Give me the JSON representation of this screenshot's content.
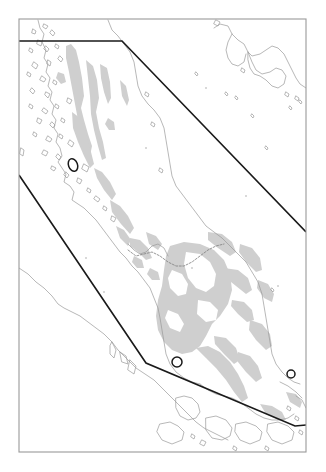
{
  "figure": {
    "kind": "reference-map",
    "region_name": "Malay Peninsula",
    "background_color": "#ffffff",
    "land_fill_color": "#ffffff",
    "highland_fill_color": "#cfcfcf",
    "coastline_color": "#9a9a9a",
    "border_color": "#8a8a8a",
    "frame_color": "#9a9a9a",
    "study_area_color": "#1a1a1a",
    "marker_color": "#1a1a1a",
    "title": "",
    "subtitle": "",
    "legend": "",
    "scale_bar": "",
    "north_arrow": "",
    "axis_labels": []
  },
  "frame": {
    "x": 19,
    "y": 19,
    "width": 287,
    "height": 433,
    "stroke_width": 1.1
  },
  "study_area": {
    "label": "",
    "stroke_width": 1.6,
    "vertices": [
      [
        19,
        41
      ],
      [
        122,
        41
      ],
      [
        306,
        232
      ],
      [
        306,
        425
      ],
      [
        295,
        426
      ],
      [
        146,
        363
      ],
      [
        19,
        175
      ]
    ],
    "segments_visible": [
      "top-horizontal",
      "upper-diagonal-to-right-frame",
      "right-frame-overlap",
      "lower-bend",
      "lower-diagonal-to-left-frame"
    ]
  },
  "markers": [
    {
      "name": "site-northwest",
      "x": 73,
      "y": 165,
      "rx": 4.5,
      "ry": 6.5,
      "rotation": -20
    },
    {
      "name": "site-central",
      "x": 177,
      "y": 362,
      "rx": 5.0,
      "ry": 5.0,
      "rotation": 0
    },
    {
      "name": "site-east",
      "x": 291,
      "y": 374,
      "rx": 4.0,
      "ry": 4.0,
      "rotation": 0
    }
  ],
  "map_features": {
    "landmasses": [
      "Peninsular Thailand",
      "Peninsular Malaysia",
      "Andaman Sea islands",
      "Borneo northwest coast",
      "Sumatra northeast coast",
      "Singapore / Riau islands"
    ],
    "water_bodies": [
      "Andaman Sea",
      "Gulf of Thailand",
      "Strait of Malacca",
      "South China Sea"
    ]
  },
  "chart_data": {
    "type": "map",
    "title": "",
    "xlabel": "",
    "ylabel": "",
    "grid": false,
    "legend_position": "none"
  }
}
